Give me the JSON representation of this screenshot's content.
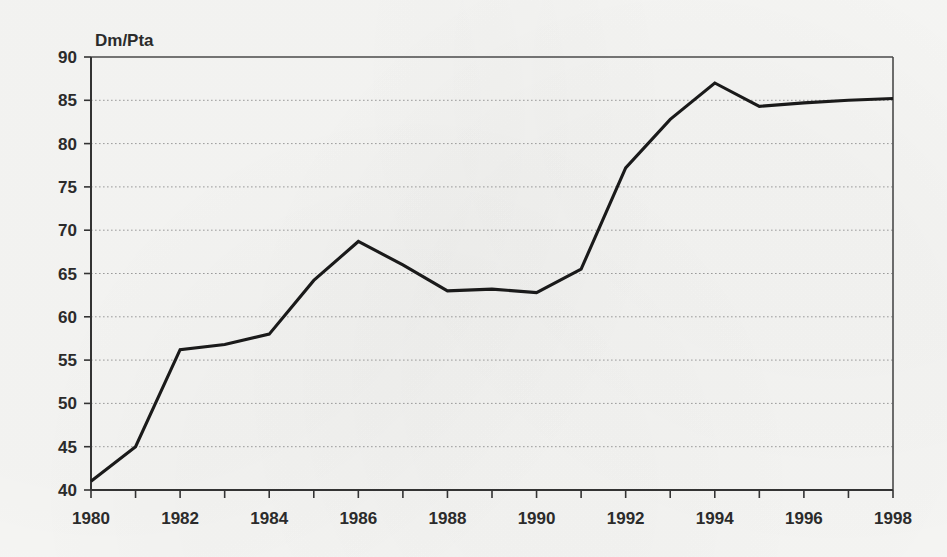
{
  "chart_data": {
    "type": "line",
    "title": "",
    "subtitle": "",
    "ylabel": "Dm/Pta",
    "xlabel": "",
    "xlim": [
      1980,
      1998
    ],
    "ylim": [
      40,
      90
    ],
    "grid": true,
    "legend": null,
    "yticks": [
      40,
      45,
      50,
      55,
      60,
      65,
      70,
      75,
      80,
      85,
      90
    ],
    "ytick_labels": [
      "40",
      "45",
      "50",
      "55",
      "60",
      "65",
      "70",
      "75",
      "80",
      "85",
      "90"
    ],
    "xticks": [
      1980,
      1981,
      1982,
      1983,
      1984,
      1985,
      1986,
      1987,
      1988,
      1989,
      1990,
      1991,
      1992,
      1993,
      1994,
      1995,
      1996,
      1997,
      1998
    ],
    "xtick_labels_shown": [
      "1980",
      "1982",
      "1984",
      "1986",
      "1988",
      "1990",
      "1992",
      "1994",
      "1996",
      "1998"
    ],
    "xtick_label_step": 2,
    "x": [
      1980,
      1981,
      1982,
      1983,
      1984,
      1985,
      1986,
      1987,
      1988,
      1989,
      1990,
      1991,
      1992,
      1993,
      1994,
      1995,
      1996,
      1997,
      1998
    ],
    "values": [
      41.0,
      45.0,
      56.2,
      56.8,
      58.0,
      64.2,
      68.7,
      66.0,
      63.0,
      63.2,
      62.8,
      65.5,
      77.2,
      82.8,
      87.0,
      84.3,
      84.7,
      85.0,
      85.2
    ],
    "series": [
      {
        "name": "Dm/Pta",
        "color": "#1a1a1a",
        "values": [
          41.0,
          45.0,
          56.2,
          56.8,
          58.0,
          64.2,
          68.7,
          66.0,
          63.0,
          63.2,
          62.8,
          65.5,
          77.2,
          82.8,
          87.0,
          84.3,
          84.7,
          85.0,
          85.2
        ]
      }
    ]
  },
  "style": {
    "background": "#f7f7f5",
    "line_color": "#1a1a1a",
    "axis_color": "#333333",
    "grid_color": "#9a9a9a",
    "text_color": "#2b2b2b"
  }
}
